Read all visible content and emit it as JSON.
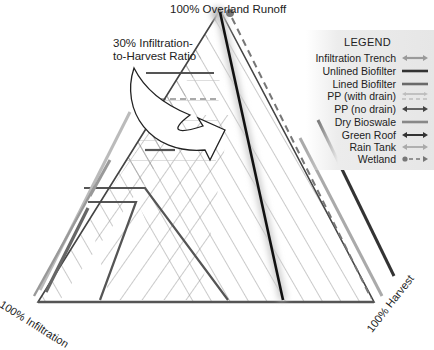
{
  "labels": {
    "apex": "100% Overland Runoff",
    "ratio_line1": "30% Infiltration-",
    "ratio_line2": "to-Harvest Ratio",
    "left_corner": "100% Infiltration",
    "right_corner": "100% Harvest"
  },
  "legend": {
    "title": "LEGEND",
    "items": [
      {
        "label": "Infiltration Trench",
        "style": "double-arrow",
        "color": "#9a9a9a"
      },
      {
        "label": "Unlined Biofilter",
        "style": "solid-line",
        "color": "#333333"
      },
      {
        "label": "Lined Biofilter",
        "style": "solid-line",
        "color": "#6a6a6a"
      },
      {
        "label": "PP (with drain)",
        "style": "dashed-double-arrow",
        "color": "#bdbdbd"
      },
      {
        "label": "PP (no drain)",
        "style": "double-arrow",
        "color": "#444444"
      },
      {
        "label": "Dry Bioswale",
        "style": "solid-line",
        "color": "#888888"
      },
      {
        "label": "Green Roof",
        "style": "double-arrow",
        "color": "#333333"
      },
      {
        "label": "Rain Tank",
        "style": "double-arrow",
        "color": "#aaaaaa"
      },
      {
        "label": "Wetland",
        "style": "dot-dash-arrow",
        "color": "#777777"
      }
    ]
  },
  "colors": {
    "hatch": "#8a8a8a",
    "region_border": "#555555",
    "triangle": "#444444",
    "divider": "#111111"
  }
}
